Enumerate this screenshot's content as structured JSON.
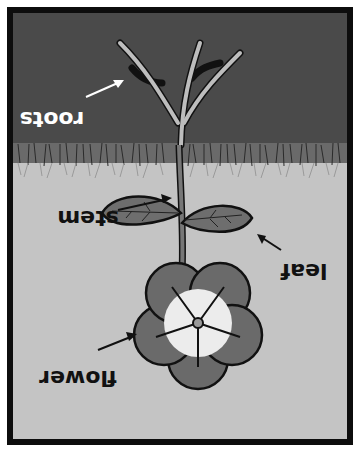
{
  "diagram": {
    "orientation": "rotated 180 degrees (upside down)",
    "colors": {
      "frame": "#0d0d0d",
      "soil": "#4a4a4a",
      "soil_top": "#6a6a6a",
      "sky": "#c4c4c4",
      "roots_fill": "#bdbdbd",
      "leaf_fill": "#6e6e6e",
      "petal_outer": "#6a6a6a",
      "petal_inner": "#ececec",
      "label_on_soil": "#ffffff",
      "label_on_sky": "#111111"
    },
    "labels": {
      "roots": "roots",
      "stem": "stem",
      "leaf": "leaf",
      "flower": "flower"
    }
  }
}
